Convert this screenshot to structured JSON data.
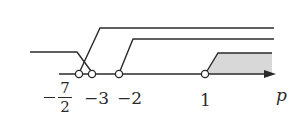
{
  "diagram": {
    "type": "number-line-solution-sets",
    "axis": {
      "variable": "p",
      "arrow": true
    },
    "colors": {
      "line": "#2a2a2a",
      "shade": "#d8d8d8",
      "background": "#ffffff"
    },
    "points": [
      {
        "value": "-7/2",
        "numerator": "7",
        "denominator": "2",
        "sign": "−",
        "open": true
      },
      {
        "value": "-3",
        "label": "−3",
        "open": true
      },
      {
        "value": "-2",
        "label": "−2",
        "open": true
      },
      {
        "value": "1",
        "label": "1",
        "open": true
      }
    ],
    "labels": {
      "frac_num": "7",
      "frac_den": "2",
      "minus_three": "−3",
      "minus_two": "−2",
      "one": "1",
      "axis_var": "p"
    },
    "sets": [
      {
        "name": "p < -3 (left ray)",
        "from": "-inf",
        "to": "-3"
      },
      {
        "name": "p > -7/2",
        "from": "-7/2",
        "to": "+inf"
      },
      {
        "name": "p > -2",
        "from": "-2",
        "to": "+inf"
      },
      {
        "name": "p > 1 (shaded intersection)",
        "from": "1",
        "to": "+inf",
        "shaded": true
      }
    ]
  }
}
